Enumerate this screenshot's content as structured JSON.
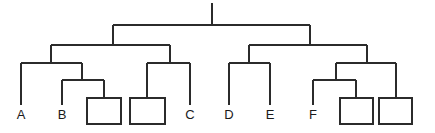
{
  "diagram": {
    "type": "tree",
    "stroke_color": "#2b2b2b",
    "box_fill": "#ffffff",
    "background": "#ffffff",
    "labels": [
      {
        "id": "A",
        "text": "A",
        "x": 21,
        "y": 119
      },
      {
        "id": "B",
        "text": "B",
        "x": 62,
        "y": 119
      },
      {
        "id": "C",
        "text": "C",
        "x": 190,
        "y": 119
      },
      {
        "id": "D",
        "text": "D",
        "x": 229,
        "y": 119
      },
      {
        "id": "E",
        "text": "E",
        "x": 270,
        "y": 119
      },
      {
        "id": "F",
        "text": "F",
        "x": 313,
        "y": 119
      }
    ],
    "boxes": [
      {
        "id": "box-1",
        "x": 87,
        "y": 98,
        "width": 34,
        "height": 26
      },
      {
        "id": "box-2",
        "x": 130,
        "y": 98,
        "width": 35,
        "height": 26
      },
      {
        "id": "box-3",
        "x": 340,
        "y": 98,
        "width": 33,
        "height": 26
      },
      {
        "id": "box-4",
        "x": 379,
        "y": 98,
        "width": 33,
        "height": 26
      }
    ],
    "edges": [
      {
        "id": "root-stem",
        "d": "M212,3 L212,25"
      },
      {
        "id": "root-bar",
        "d": "M113,25 L310,25"
      },
      {
        "id": "left-branch-drop",
        "d": "M113,25 L113,45"
      },
      {
        "id": "right-branch-drop",
        "d": "M310,25 L310,45"
      },
      {
        "id": "left-bar",
        "d": "M51,45 L170,45"
      },
      {
        "id": "left-a-drop",
        "d": "M51,45 L51,63"
      },
      {
        "id": "left-c-drop",
        "d": "M170,45 L170,63"
      },
      {
        "id": "right-bar",
        "d": "M249,45 L367,45"
      },
      {
        "id": "right-d-drop",
        "d": "M249,45 L249,63"
      },
      {
        "id": "right-f-drop",
        "d": "M367,45 L367,63"
      },
      {
        "id": "group-ab-bar",
        "d": "M21,63 L82,63"
      },
      {
        "id": "leaf-a-stem",
        "d": "M21,63 L21,105"
      },
      {
        "id": "group-ab-sub-drop",
        "d": "M82,63 L82,80"
      },
      {
        "id": "group-ab-sub-bar",
        "d": "M62,80 L104,80"
      },
      {
        "id": "leaf-b-stem",
        "d": "M62,80 L62,105"
      },
      {
        "id": "box1-stem",
        "d": "M104,80 L104,98"
      },
      {
        "id": "group-c-bar",
        "d": "M147,63 L190,63"
      },
      {
        "id": "box2-stem",
        "d": "M147,63 L147,98"
      },
      {
        "id": "leaf-c-stem",
        "d": "M190,63 L190,105"
      },
      {
        "id": "group-de-bar",
        "d": "M229,63 L270,63"
      },
      {
        "id": "leaf-d-stem",
        "d": "M229,63 L229,105"
      },
      {
        "id": "leaf-e-stem",
        "d": "M270,63 L270,105"
      },
      {
        "id": "group-f-bar",
        "d": "M336,63 L396,63"
      },
      {
        "id": "group-f-sub-drop",
        "d": "M336,63 L336,80"
      },
      {
        "id": "group-f-sub-bar",
        "d": "M313,80 L356,80"
      },
      {
        "id": "leaf-f-stem",
        "d": "M313,80 L313,105"
      },
      {
        "id": "box3-stem",
        "d": "M356,80 L356,98"
      },
      {
        "id": "box4-stem",
        "d": "M396,63 L396,98"
      }
    ]
  },
  "chart_data": {
    "type": "tree",
    "levels": 4,
    "named_leaves": [
      "A",
      "B",
      "C",
      "D",
      "E",
      "F"
    ],
    "empty_box_leaves": 4,
    "total_leaves": 10,
    "structure": {
      "node": "root",
      "children": [
        {
          "node": "left",
          "children": [
            {
              "node": "left-left",
              "children": [
                {
                  "node": "leaf",
                  "label": "A"
                },
                {
                  "node": "left-left-right",
                  "children": [
                    {
                      "node": "leaf",
                      "label": "B"
                    },
                    {
                      "node": "box",
                      "label": ""
                    }
                  ]
                }
              ]
            },
            {
              "node": "left-right",
              "children": [
                {
                  "node": "box",
                  "label": ""
                },
                {
                  "node": "leaf",
                  "label": "C"
                }
              ]
            }
          ]
        },
        {
          "node": "right",
          "children": [
            {
              "node": "right-left",
              "children": [
                {
                  "node": "leaf",
                  "label": "D"
                },
                {
                  "node": "leaf",
                  "label": "E"
                }
              ]
            },
            {
              "node": "right-right",
              "children": [
                {
                  "node": "right-right-left",
                  "children": [
                    {
                      "node": "leaf",
                      "label": "F"
                    },
                    {
                      "node": "box",
                      "label": ""
                    }
                  ]
                },
                {
                  "node": "box",
                  "label": ""
                }
              ]
            }
          ]
        }
      ]
    }
  }
}
